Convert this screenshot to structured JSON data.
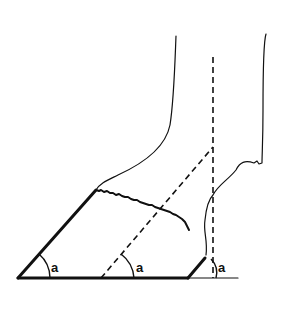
{
  "diagram": {
    "labels": {
      "toe_angle": "a",
      "axis_angle": "a",
      "heel_angle": "a"
    },
    "colors": {
      "line": "#111111",
      "background": "#ffffff"
    }
  }
}
